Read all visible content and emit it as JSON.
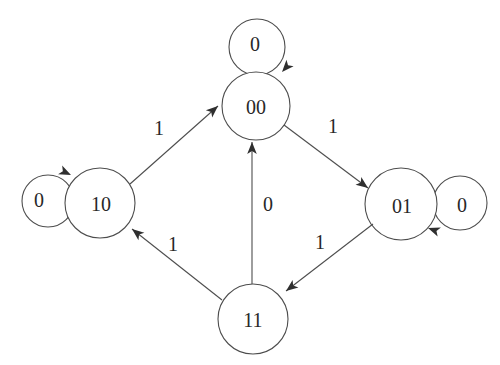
{
  "diagram": {
    "type": "state-transition-diagram",
    "colors": {
      "background": "#ffffff",
      "line": "#4d4d4d",
      "arrow": "#2f2f2f",
      "text": "#282828"
    },
    "nodes": [
      {
        "id": "00",
        "label": "00",
        "position": "top-center"
      },
      {
        "id": "10",
        "label": "10",
        "position": "left"
      },
      {
        "id": "01",
        "label": "01",
        "position": "right"
      },
      {
        "id": "11",
        "label": "11",
        "position": "bottom-center"
      }
    ],
    "self_loops": [
      {
        "node": "00",
        "label": "0",
        "placement": "above"
      },
      {
        "node": "10",
        "label": "0",
        "placement": "left"
      },
      {
        "node": "01",
        "label": "0",
        "placement": "right"
      }
    ],
    "edges": [
      {
        "from": "10",
        "to": "00",
        "label": "1"
      },
      {
        "from": "00",
        "to": "01",
        "label": "1"
      },
      {
        "from": "11",
        "to": "00",
        "label": "0"
      },
      {
        "from": "01",
        "to": "11",
        "label": "1"
      },
      {
        "from": "11",
        "to": "10",
        "label": "1"
      }
    ]
  }
}
